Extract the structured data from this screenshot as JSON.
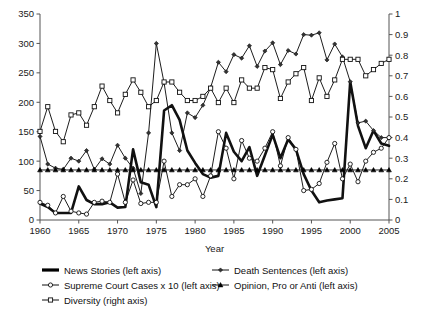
{
  "chart_data": {
    "type": "line",
    "title": "",
    "xlabel": "Year",
    "ylabel_left": "",
    "ylabel_right": "",
    "xlim": [
      1960,
      2005
    ],
    "ylim_left": [
      0,
      350
    ],
    "ylim_right": [
      0,
      1
    ],
    "grid": false,
    "legend_position": "bottom",
    "x_ticks": [
      "1960",
      "1965",
      "1970",
      "1975",
      "1980",
      "1985",
      "1990",
      "1995",
      "2000",
      "2005"
    ],
    "y_ticks_left": [
      "0",
      "50",
      "100",
      "150",
      "200",
      "250",
      "300",
      "350"
    ],
    "y_ticks_right": [
      "0",
      "0.1",
      "0.2",
      "0.3",
      "0.4",
      "0.5",
      "0.6",
      "0.7",
      "0.8",
      "0.9",
      "1"
    ],
    "x": [
      1960,
      1961,
      1962,
      1963,
      1964,
      1965,
      1966,
      1967,
      1968,
      1969,
      1970,
      1971,
      1972,
      1973,
      1974,
      1975,
      1976,
      1977,
      1978,
      1979,
      1980,
      1981,
      1982,
      1983,
      1984,
      1985,
      1986,
      1987,
      1988,
      1989,
      1990,
      1991,
      1992,
      1993,
      1994,
      1995,
      1996,
      1997,
      1998,
      1999,
      2000,
      2001,
      2002,
      2003,
      2004,
      2005
    ],
    "series": [
      {
        "name": "News Stories (left axis)",
        "axis": "left",
        "marker": "none",
        "line": "thick",
        "values": [
          28,
          22,
          12,
          12,
          12,
          57,
          34,
          27,
          27,
          30,
          21,
          22,
          120,
          64,
          60,
          22,
          186,
          195,
          170,
          118,
          97,
          78,
          72,
          75,
          148,
          116,
          100,
          124,
          75,
          110,
          145,
          105,
          137,
          120,
          78,
          50,
          30,
          33,
          35,
          37,
          235,
          160,
          122,
          152,
          130,
          126
        ]
      },
      {
        "name": "Death Sentences (left axis)",
        "axis": "left",
        "marker": "diamond",
        "line": "thin",
        "values": [
          142,
          95,
          88,
          86,
          105,
          100,
          118,
          86,
          104,
          95,
          127,
          105,
          88,
          45,
          148,
          300,
          233,
          148,
          118,
          182,
          174,
          195,
          225,
          268,
          252,
          281,
          275,
          296,
          261,
          287,
          301,
          264,
          288,
          282,
          315,
          314,
          318,
          272,
          299,
          277,
          235,
          165,
          168,
          152,
          140,
          140
        ]
      },
      {
        "name": "Supreme Court Cases x 10 (left axis)",
        "axis": "left",
        "marker": "circle",
        "line": "thin",
        "values": [
          30,
          25,
          12,
          40,
          15,
          12,
          10,
          30,
          32,
          30,
          78,
          30,
          68,
          28,
          30,
          30,
          100,
          40,
          60,
          60,
          70,
          40,
          75,
          150,
          122,
          70,
          135,
          105,
          100,
          122,
          150,
          92,
          140,
          120,
          50,
          52,
          62,
          98,
          130,
          70,
          95,
          65,
          100,
          115,
          122,
          140
        ]
      },
      {
        "name": "Opinion, Pro or Anti (left axis)",
        "axis": "left",
        "marker": "triangle",
        "line": "thin",
        "values": [
          85,
          85,
          85,
          85,
          85,
          85,
          85,
          85,
          85,
          85,
          85,
          85,
          85,
          85,
          85,
          85,
          85,
          85,
          85,
          85,
          85,
          85,
          85,
          85,
          85,
          85,
          85,
          85,
          85,
          85,
          85,
          85,
          85,
          85,
          85,
          85,
          85,
          85,
          85,
          85,
          85,
          85,
          85,
          85,
          85,
          85
        ]
      },
      {
        "name": "Diversity (right axis)",
        "axis": "right",
        "marker": "square",
        "line": "thin",
        "values": [
          0.43,
          0.55,
          0.43,
          0.38,
          0.51,
          0.52,
          0.46,
          0.55,
          0.65,
          0.58,
          0.52,
          0.61,
          0.68,
          0.62,
          0.55,
          0.58,
          0.67,
          0.67,
          0.62,
          0.58,
          0.58,
          0.6,
          0.64,
          0.57,
          0.64,
          0.57,
          0.68,
          0.64,
          0.64,
          0.74,
          0.73,
          0.59,
          0.67,
          0.71,
          0.74,
          0.58,
          0.69,
          0.6,
          0.68,
          0.78,
          0.78,
          0.78,
          0.7,
          0.73,
          0.76,
          0.78
        ]
      }
    ],
    "legend": [
      {
        "label": "News Stories (left axis)",
        "marker": "thick-line",
        "color": "#000000"
      },
      {
        "label": "Death Sentences (left axis)",
        "marker": "diamond",
        "color": "#000000"
      },
      {
        "label": "Supreme Court Cases x 10 (left axis)",
        "marker": "circle",
        "color": "#000000"
      },
      {
        "label": "Opinion, Pro or Anti (left axis)",
        "marker": "triangle",
        "color": "#000000"
      },
      {
        "label": "Diversity (right axis)",
        "marker": "square",
        "color": "#000000"
      }
    ]
  }
}
